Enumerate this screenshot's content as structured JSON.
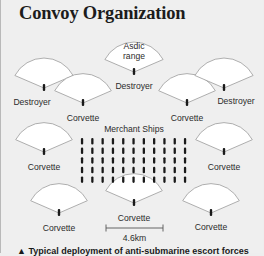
{
  "title": "Convoy Organization",
  "colors": {
    "background": "#efefef",
    "fan_fill": "#ffffff",
    "fan_stroke": "#9a9a9a",
    "ship": "#1a1a1a",
    "text": "#2b2b2b"
  },
  "escorts": [
    {
      "id": "destroyer-top-center",
      "type": "Destroyer",
      "label": "Destroyer",
      "inner_label": [
        "Asdic",
        "range"
      ],
      "apex": [
        133,
        72
      ],
      "radius": 33,
      "label_pos": [
        133,
        83
      ]
    },
    {
      "id": "destroyer-left",
      "type": "Destroyer",
      "label": "Destroyer",
      "apex": [
        43,
        88
      ],
      "radius": 33,
      "label_pos": [
        31,
        99
      ]
    },
    {
      "id": "corvette-upper-left",
      "type": "Corvette",
      "label": "Corvette",
      "apex": [
        82,
        103
      ],
      "radius": 32,
      "label_pos": [
        82,
        115
      ]
    },
    {
      "id": "corvette-upper-right",
      "type": "Corvette",
      "label": "Corvette",
      "apex": [
        186,
        103
      ],
      "radius": 32,
      "label_pos": [
        186,
        115
      ]
    },
    {
      "id": "destroyer-right",
      "type": "Destroyer",
      "label": "Destroyer",
      "apex": [
        223,
        88
      ],
      "radius": 33,
      "label_pos": [
        235,
        98
      ]
    },
    {
      "id": "corvette-mid-left",
      "type": "Corvette",
      "label": "Corvette",
      "apex": [
        43,
        152
      ],
      "radius": 32,
      "label_pos": [
        43,
        164
      ]
    },
    {
      "id": "corvette-mid-right",
      "type": "Corvette",
      "label": "Corvette",
      "apex": [
        223,
        152
      ],
      "radius": 32,
      "label_pos": [
        223,
        164
      ]
    },
    {
      "id": "corvette-bottom-left",
      "type": "Corvette",
      "label": "Corvette",
      "apex": [
        58,
        213
      ],
      "radius": 32,
      "label_pos": [
        58,
        225
      ]
    },
    {
      "id": "corvette-bottom-center",
      "type": "Corvette",
      "label": "Corvette",
      "apex": [
        133,
        203
      ],
      "radius": 32,
      "label_pos": [
        133,
        215
      ]
    },
    {
      "id": "corvette-bottom-right",
      "type": "Corvette",
      "label": "Corvette",
      "apex": [
        210,
        213
      ],
      "radius": 32,
      "label_pos": [
        210,
        224
      ]
    }
  ],
  "merchant_ships": {
    "label": "Merchant Ships",
    "label_pos": [
      133,
      132
    ],
    "columns": 11,
    "rows": 5,
    "x_start": 81,
    "x_step": 10.3,
    "y_start": 138,
    "y_step": 9.6
  },
  "scale_bar": {
    "label": "4.6km",
    "x1": 105,
    "x2": 162,
    "y": 228
  },
  "caption": "▲ Typical deployment of anti-submarine escort forces"
}
